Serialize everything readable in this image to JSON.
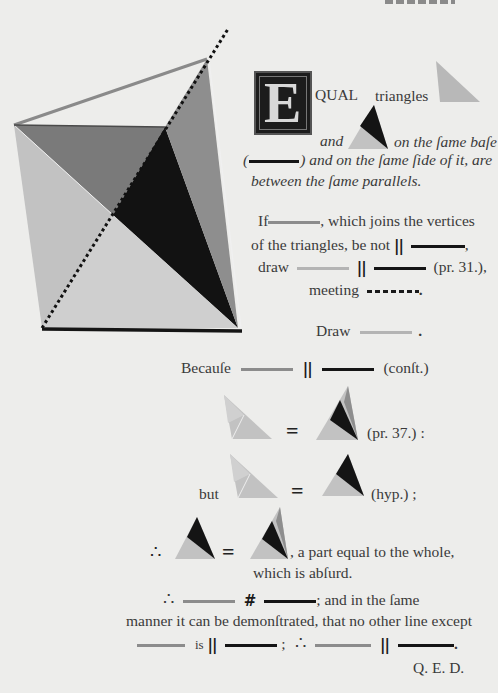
{
  "page": {
    "header_fragment": "",
    "drop_cap": "E",
    "opening": {
      "word_after_cap": "QUAL",
      "triangles": "triangles",
      "and": "and",
      "on_same_base": "on the ſame baſe",
      "paren_open": "(",
      "paren_close": ")",
      "same_side": "and on the ſame ſide of it, are",
      "between": "between the ſame parallels."
    },
    "if_block": {
      "if": "If",
      "which_joins": ", which joins the vertices",
      "of_triangles": "of the triangles, be not",
      "comma": ",",
      "draw": "draw",
      "pr31": "(pr. 31.),",
      "meeting": "meeting",
      "period": "."
    },
    "draw_line": {
      "draw": "Draw",
      "period": "."
    },
    "because": {
      "label": "Becauſe",
      "const": "(conſt.)"
    },
    "eq1": {
      "ref": "(pr. 37.) :"
    },
    "eq2": {
      "but": "but",
      "ref": "(hyp.) ;"
    },
    "eq3": {
      "therefore": "∴",
      "text": ", a part equal to the whole,",
      "absurd": "which is abſurd."
    },
    "conclusion": {
      "therefore": "∴",
      "same_manner": "; and in the ſame",
      "line2": "manner it can be demonſtrated, that no other line except",
      "is": "is",
      "semi": ";",
      "therefore2": "∴",
      "period": "."
    },
    "qed": "Q. E. D.",
    "symbols": {
      "parallel": "||",
      "not_parallel": "#",
      "equals": "="
    }
  },
  "colors": {
    "paper": "#ededeb",
    "light_gray": "#c4c4c4",
    "mid_gray": "#8f8f8f",
    "dark_gray": "#6e6e6e",
    "black": "#121212"
  }
}
